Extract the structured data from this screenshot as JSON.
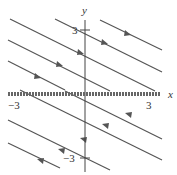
{
  "axes": {
    "x_label": "x",
    "y_label": "y",
    "x_ticks": [
      "−3",
      "3"
    ],
    "y_ticks": [
      "3",
      "−3"
    ]
  },
  "colors": {
    "line": "#555555",
    "axis": "#444444",
    "equilibrium": "#666666"
  }
}
